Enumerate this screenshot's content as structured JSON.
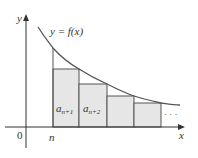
{
  "diagram": {
    "type": "integral-test-rectangles",
    "axes": {
      "x_label": "x",
      "y_label": "y",
      "origin_label": "0",
      "n_label": "n"
    },
    "curve_label": "y = f(x)",
    "rectangles": [
      {
        "label_base": "a",
        "label_sub": "n+1"
      },
      {
        "label_base": "a",
        "label_sub": "n+2"
      },
      {
        "label_base": "",
        "label_sub": ""
      },
      {
        "label_base": "",
        "label_sub": ""
      }
    ],
    "ellipsis": "· · ·",
    "colors": {
      "axis": "#333333",
      "curve": "#555555",
      "rect_fill": "#e6e6e6",
      "rect_stroke": "#555555",
      "background": "#ffffff"
    }
  }
}
